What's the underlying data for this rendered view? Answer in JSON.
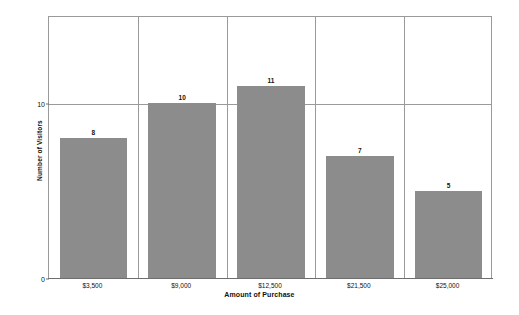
{
  "chart_data": {
    "type": "bar",
    "title": "",
    "xlabel": "Amount of Purchase",
    "ylabel": "Number of Visitors",
    "categories": [
      "$3,500",
      "$9,000",
      "$12,500",
      "$21,500",
      "$25,000"
    ],
    "values": [
      8,
      10,
      11,
      7,
      5
    ],
    "value_labels": [
      "8",
      "10",
      "11",
      "7",
      "5"
    ],
    "ylim": [
      0,
      15
    ],
    "ytick_values": [
      0,
      10
    ],
    "ytick_labels": [
      "0",
      "10"
    ],
    "grid": "horizontal gridline at 10; vertical separators between categories",
    "legend": "none",
    "bar_color": "#8c8c8c",
    "grid_color": "#9a9a9a",
    "axis_color": "#6e6e6e",
    "background": "#ffffff"
  }
}
